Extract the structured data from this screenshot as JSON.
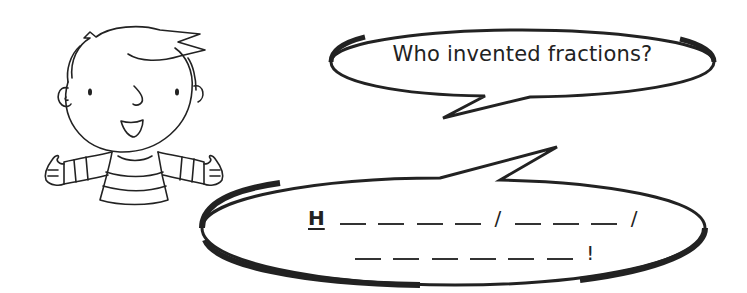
{
  "illustration": {
    "character": "cartoon boy with striped shirt, arms open, smiling",
    "icon": "boy-character"
  },
  "question_bubble": {
    "text": "Who invented fractions?"
  },
  "answer_bubble": {
    "line1": {
      "given_letter": "H",
      "groups": [
        {
          "blanks": 4,
          "separator": "/"
        },
        {
          "blanks": 3,
          "separator": "/"
        }
      ]
    },
    "line2": {
      "blanks": 6,
      "end_mark": "!"
    },
    "word_lengths": [
      5,
      3,
      6
    ]
  },
  "colors": {
    "ink": "#222222",
    "background": "#ffffff"
  }
}
